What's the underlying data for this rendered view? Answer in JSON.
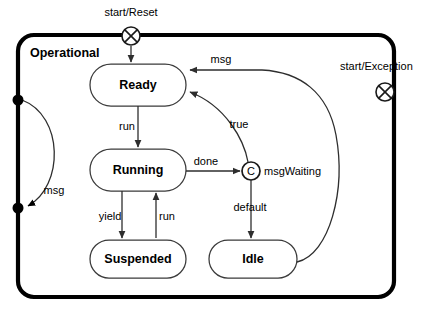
{
  "diagram": {
    "type": "uml-state-machine",
    "region": {
      "name": "Operational",
      "x": 18,
      "y": 35,
      "width": 376,
      "height": 262,
      "corner_radius": 16
    },
    "states": [
      {
        "id": "ready",
        "label": "Ready",
        "cx": 138,
        "cy": 85,
        "width": 96,
        "height": 42
      },
      {
        "id": "running",
        "label": "Running",
        "cx": 138,
        "cy": 170,
        "width": 96,
        "height": 42
      },
      {
        "id": "suspended",
        "label": "Suspended",
        "cx": 138,
        "cy": 259,
        "width": 96,
        "height": 38
      },
      {
        "id": "idle",
        "label": "Idle",
        "cx": 253,
        "cy": 259,
        "width": 88,
        "height": 38
      }
    ],
    "pseudostates": [
      {
        "id": "entry-reset",
        "kind": "entry-exit-point",
        "label": "start/Reset",
        "cx": 131,
        "cy": 36,
        "r": 9,
        "label_x": 131,
        "label_y": 16,
        "label_anchor": "middle"
      },
      {
        "id": "entry-exception",
        "kind": "entry-exit-point",
        "label": "start/Exception",
        "cx": 385,
        "cy": 92,
        "r": 9,
        "label_x": 340,
        "label_y": 70,
        "label_anchor": "start"
      }
    ],
    "choice": {
      "id": "msg-waiting-choice",
      "letter": "C",
      "label": "msgWaiting",
      "cx": 251,
      "cy": 171,
      "r": 9,
      "label_x": 264,
      "label_y": 175
    },
    "junctions": [
      {
        "id": "junction-top",
        "cx": 18,
        "cy": 100,
        "r": 5.5
      },
      {
        "id": "junction-bottom",
        "cx": 18,
        "cy": 208,
        "r": 5.5
      }
    ],
    "transitions": [
      {
        "id": "reset-to-ready",
        "label": "",
        "from": "entry-reset",
        "to": "ready"
      },
      {
        "id": "ready-to-running",
        "label": "run",
        "from": "ready",
        "to": "running",
        "label_x": 127,
        "label_y": 130
      },
      {
        "id": "running-to-choice",
        "label": "done",
        "from": "running",
        "to": "choice",
        "label_x": 206,
        "label_y": 165
      },
      {
        "id": "choice-to-ready",
        "label": "true",
        "from": "choice",
        "to": "ready",
        "label_x": 239,
        "label_y": 128
      },
      {
        "id": "choice-to-idle",
        "label": "default",
        "from": "choice",
        "to": "idle",
        "label_x": 250,
        "label_y": 211
      },
      {
        "id": "running-to-suspended",
        "label": "yield",
        "from": "running",
        "to": "suspended",
        "label_x": 110,
        "label_y": 220
      },
      {
        "id": "suspended-to-running",
        "label": "run",
        "from": "suspended",
        "to": "running",
        "label_x": 157,
        "label_y": 220
      },
      {
        "id": "idle-to-ready",
        "label": "msg",
        "from": "idle",
        "to": "ready",
        "label_x": 221,
        "label_y": 63
      },
      {
        "id": "junction-msg",
        "label": "msg",
        "from": "junction-top",
        "to": "junction-bottom",
        "label_x": 54,
        "label_y": 194
      }
    ]
  }
}
